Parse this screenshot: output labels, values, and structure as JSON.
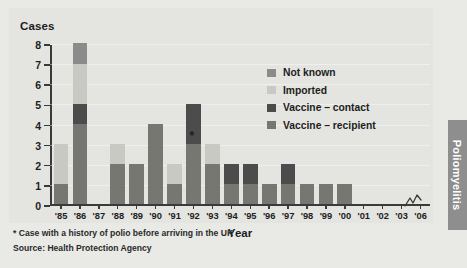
{
  "side_tab": {
    "label": "Poliomyelitis"
  },
  "footer": {
    "footnote": "* Case with a history of polio before arriving in the UK",
    "source": "Source: Health Protection Agency"
  },
  "legend": {
    "items": [
      {
        "label": "Not known",
        "color": "#8b8b8b"
      },
      {
        "label": "Imported",
        "color": "#c9c9c4"
      },
      {
        "label": "Vaccine – contact",
        "color": "#4c4c4c"
      },
      {
        "label": "Vaccine – recipient",
        "color": "#777772"
      }
    ]
  },
  "chart_data": {
    "type": "bar",
    "title": "",
    "ylabel": "Cases",
    "xlabel": "Year",
    "ylim": [
      0,
      8
    ],
    "yticks": [
      0,
      1,
      2,
      3,
      4,
      5,
      6,
      7,
      8
    ],
    "grid": true,
    "stacked": true,
    "legend_position": "inside-top-right",
    "axis_break": {
      "between": [
        "'03",
        "'06"
      ],
      "symbol": "zigzag"
    },
    "annotations": [
      {
        "text": "*",
        "x": "'92",
        "y": 3.2,
        "note": "* Case with a history of polio before arriving in the UK"
      }
    ],
    "categories": [
      "'85",
      "'86",
      "'87",
      "'88",
      "'89",
      "'90",
      "'91",
      "'92",
      "'93",
      "'94",
      "'95",
      "'96",
      "'97",
      "'98",
      "'99",
      "'00",
      "'01",
      "'02",
      "'03",
      "'06"
    ],
    "series": [
      {
        "name": "Vaccine – recipient",
        "color": "#777772",
        "values": [
          1,
          4,
          0,
          2,
          2,
          4,
          1,
          3,
          2,
          1,
          1,
          1,
          1,
          1,
          1,
          1,
          0,
          0,
          0,
          0
        ]
      },
      {
        "name": "Vaccine – contact",
        "color": "#4c4c4c",
        "values": [
          0,
          1,
          0,
          0,
          0,
          0,
          0,
          2,
          0,
          1,
          1,
          0,
          1,
          0,
          0,
          0,
          0,
          0,
          0,
          0
        ]
      },
      {
        "name": "Imported",
        "color": "#c9c9c4",
        "values": [
          2,
          2,
          0,
          1,
          0,
          0,
          1,
          0,
          1,
          0,
          0,
          0,
          0,
          0,
          0,
          0,
          0,
          0,
          0,
          0
        ]
      },
      {
        "name": "Not known",
        "color": "#8b8b8b",
        "values": [
          0,
          1,
          0,
          0,
          0,
          0,
          0,
          0,
          0,
          0,
          0,
          0,
          0,
          0,
          0,
          0,
          0,
          0,
          0,
          0
        ]
      }
    ],
    "totals": [
      3,
      8,
      0,
      3,
      2,
      4,
      2,
      5,
      3,
      2,
      2,
      1,
      2,
      1,
      1,
      1,
      0,
      0,
      0,
      0
    ]
  }
}
